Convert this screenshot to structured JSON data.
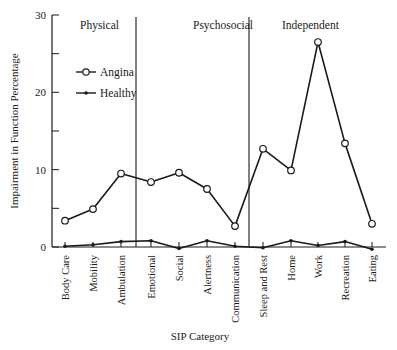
{
  "chart_data": {
    "type": "line",
    "title": "",
    "xlabel": "SIP Category",
    "ylabel": "Impairment in Function Percentage",
    "ylim": [
      0,
      30
    ],
    "yticks": [
      0,
      10,
      20,
      30
    ],
    "yminor_ticks": [
      5,
      15,
      25
    ],
    "grid": false,
    "legend_position": "upper-left",
    "categories": [
      "Body Care",
      "Mobility",
      "Ambulation",
      "Emotional",
      "Social",
      "Alertness",
      "Communication",
      "Sleep and Rest",
      "Home",
      "Work",
      "Recreation",
      "Eating"
    ],
    "series": [
      {
        "name": "Angina",
        "marker": "open-circle",
        "values": [
          3.4,
          4.9,
          9.5,
          8.4,
          9.6,
          7.5,
          2.7,
          12.7,
          9.9,
          26.5,
          13.4,
          3.0
        ]
      },
      {
        "name": "Healthy",
        "marker": "filled-dot",
        "values": [
          0.1,
          0.3,
          0.7,
          0.8,
          -0.2,
          0.8,
          0.1,
          -0.1,
          0.8,
          0.2,
          0.7,
          -0.3
        ]
      }
    ],
    "sections": [
      {
        "label": "Physical",
        "start": 0,
        "end": 2
      },
      {
        "label": "Psychosocial",
        "start": 3,
        "end": 6
      },
      {
        "label": "Independent",
        "start": 7,
        "end": 11
      }
    ],
    "colors": {
      "line": "#1a1a1a",
      "background": "#ffffff"
    }
  }
}
